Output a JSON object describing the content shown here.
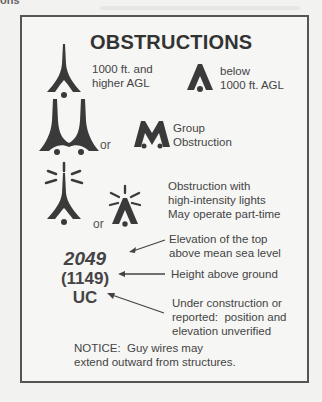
{
  "background": {
    "fragment_text": "ons"
  },
  "legend": {
    "title": "OBSTRUCTIONS",
    "colors": {
      "symbol": "#3a3a3a",
      "border": "#555555",
      "text": "#444444"
    },
    "rows": [
      {
        "id": "single",
        "items": [
          {
            "icon": "tall-obstruction-icon",
            "label": "1000 ft. and\nhigher AGL"
          },
          {
            "icon": "short-obstruction-icon",
            "label": "below\n1000 ft. AGL"
          }
        ]
      },
      {
        "id": "group",
        "connector": "or",
        "icons": [
          "tall-group-obstruction-icon",
          "short-group-obstruction-icon"
        ],
        "label": "Group\nObstruction"
      },
      {
        "id": "lighted",
        "connector": "or",
        "icons": [
          "tall-lighted-obstruction-icon",
          "short-lighted-obstruction-icon"
        ],
        "label": "Obstruction with\nhigh-intensity lights\nMay operate part-time"
      }
    ],
    "elevation": {
      "msl_value": "2049",
      "msl_label": "Elevation of the top\nabove mean sea level",
      "agl_value": "(1149)",
      "agl_label": "Height above ground",
      "uc_value": "UC",
      "uc_label": "Under construction or\nreported:  position and\nelevation unverified"
    },
    "notice": "NOTICE:  Guy wires may\nextend outward from structures."
  }
}
